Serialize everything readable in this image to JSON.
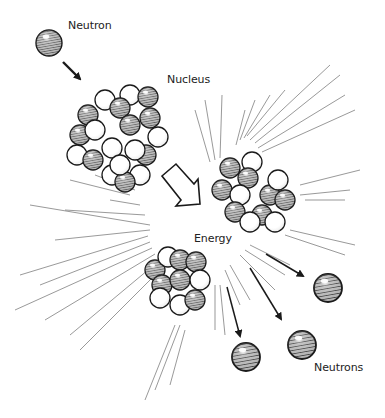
{
  "diagram": {
    "type": "nuclear-fission-illustration",
    "labels": {
      "neutron": "Neutron",
      "nucleus": "Nucleus",
      "energy": "Energy",
      "neutrons": "Neutrons"
    },
    "colors": {
      "outline": "#1a1a1a",
      "neutron_fill": "#8a8a8a",
      "proton_fill": "#ffffff",
      "burst_line": "#555555",
      "background": "#ffffff"
    },
    "elements": [
      {
        "id": "incoming-neutron",
        "kind": "particle",
        "label": "Neutron"
      },
      {
        "id": "target-nucleus",
        "kind": "nucleus",
        "label": "Nucleus"
      },
      {
        "id": "split-arrow",
        "kind": "block-arrow"
      },
      {
        "id": "fragment-upper-right",
        "kind": "nucleus-fragment"
      },
      {
        "id": "fragment-lower-left",
        "kind": "nucleus-fragment"
      },
      {
        "id": "energy-burst",
        "kind": "radial-lines",
        "label": "Energy"
      },
      {
        "id": "released-neutrons",
        "kind": "particles",
        "count": 3,
        "label": "Neutrons"
      }
    ]
  }
}
